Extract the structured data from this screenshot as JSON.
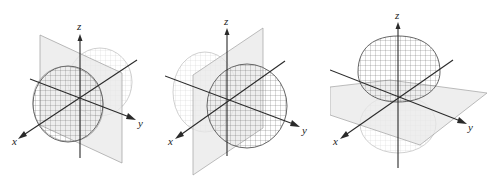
{
  "figure": {
    "panels": [
      {
        "id": "px",
        "axes": {
          "x": "x",
          "y": "y",
          "z": "z"
        },
        "lobe_axis": "x",
        "nodal_plane": "yz"
      },
      {
        "id": "py",
        "axes": {
          "x": "x",
          "y": "y",
          "z": "z"
        },
        "lobe_axis": "y",
        "nodal_plane": "xz"
      },
      {
        "id": "pz",
        "axes": {
          "x": "x",
          "y": "y",
          "z": "z"
        },
        "lobe_axis": "z",
        "nodal_plane": "xy"
      }
    ]
  },
  "colors": {
    "axis": "#2a2a2a",
    "front_lobe_stroke": "#555555",
    "back_lobe_stroke": "#b5b5b5",
    "plane_fill": "#e6e6e6",
    "plane_stroke": "#9a9a9a"
  }
}
